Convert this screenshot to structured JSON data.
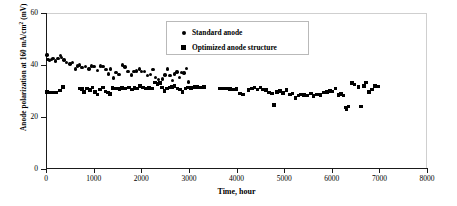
{
  "chart_data": {
    "type": "scatter",
    "title": "",
    "xlabel": "Time, hour",
    "ylabel": "Anode polarization at 160 mA/cm2 (mV)",
    "ylabel_main": "Anode polarization at 160 mA/cm",
    "ylabel_sup": "2",
    "ylabel_tail": " (mV)",
    "xlim": [
      0,
      8000
    ],
    "ylim": [
      0,
      60
    ],
    "xticks": [
      0,
      1000,
      2000,
      3000,
      4000,
      5000,
      6000,
      7000,
      8000
    ],
    "yticks": [
      0,
      20,
      40,
      60
    ],
    "xtick_labels": [
      "0",
      "1000",
      "2000",
      "3000",
      "4000",
      "5000",
      "6000",
      "7000",
      "8000"
    ],
    "ytick_labels": [
      "0",
      "20",
      "40",
      "60"
    ],
    "grid": false,
    "legend_position": "top-center",
    "series": [
      {
        "name": "Standard anode",
        "marker": "circle",
        "color": "#000000",
        "points": [
          [
            20,
            43.9
          ],
          [
            40,
            42.2
          ],
          [
            70,
            41.8
          ],
          [
            110,
            42.0
          ],
          [
            150,
            42.6
          ],
          [
            200,
            41.6
          ],
          [
            250,
            42.4
          ],
          [
            300,
            43.7
          ],
          [
            330,
            43.0
          ],
          [
            380,
            41.9
          ],
          [
            430,
            41.0
          ],
          [
            500,
            40.4
          ],
          [
            560,
            41.0
          ],
          [
            620,
            38.5
          ],
          [
            660,
            39.6
          ],
          [
            700,
            40.0
          ],
          [
            760,
            39.0
          ],
          [
            830,
            39.4
          ],
          [
            900,
            38.5
          ],
          [
            960,
            39.6
          ],
          [
            1010,
            39.4
          ],
          [
            1080,
            38.0
          ],
          [
            1140,
            39.6
          ],
          [
            1200,
            39.5
          ],
          [
            1260,
            38.3
          ],
          [
            1310,
            36.6
          ],
          [
            1360,
            38.4
          ],
          [
            1420,
            35.0
          ],
          [
            1470,
            37.0
          ],
          [
            1530,
            36.4
          ],
          [
            1600,
            40.0
          ],
          [
            1660,
            39.2
          ],
          [
            1720,
            37.4
          ],
          [
            1790,
            36.2
          ],
          [
            1850,
            37.5
          ],
          [
            1900,
            37.7
          ],
          [
            1960,
            38.4
          ],
          [
            2010,
            37.5
          ],
          [
            2070,
            37.6
          ],
          [
            2130,
            36.0
          ],
          [
            2190,
            36.4
          ],
          [
            2250,
            38.2
          ],
          [
            2300,
            35.3
          ],
          [
            2360,
            34.4
          ],
          [
            2400,
            33.2
          ],
          [
            2450,
            34.6
          ],
          [
            2500,
            36.2
          ],
          [
            2550,
            38.5
          ],
          [
            2600,
            36.0
          ],
          [
            2650,
            34.0
          ],
          [
            2700,
            36.6
          ],
          [
            2750,
            37.3
          ],
          [
            2800,
            35.2
          ],
          [
            2850,
            37.0
          ],
          [
            2900,
            36.9
          ],
          [
            2950,
            38.6
          ],
          [
            2990,
            33.4
          ]
        ]
      },
      {
        "name": "Optimized anode structure",
        "marker": "square",
        "color": "#000000",
        "points": [
          [
            20,
            29.6
          ],
          [
            60,
            29.5
          ],
          [
            140,
            29.4
          ],
          [
            210,
            29.5
          ],
          [
            300,
            30.2
          ],
          [
            360,
            31.6
          ],
          [
            700,
            31.0
          ],
          [
            760,
            30.7
          ],
          [
            800,
            29.6
          ],
          [
            860,
            31.0
          ],
          [
            920,
            30.3
          ],
          [
            980,
            31.3
          ],
          [
            1030,
            29.6
          ],
          [
            1080,
            28.7
          ],
          [
            1140,
            30.6
          ],
          [
            1200,
            31.3
          ],
          [
            1250,
            29.8
          ],
          [
            1300,
            29.5
          ],
          [
            1350,
            28.9
          ],
          [
            1400,
            31.2
          ],
          [
            1470,
            31.0
          ],
          [
            1540,
            30.8
          ],
          [
            1600,
            31.1
          ],
          [
            1670,
            31.0
          ],
          [
            1740,
            31.3
          ],
          [
            1800,
            30.6
          ],
          [
            1860,
            31.2
          ],
          [
            1920,
            31.0
          ],
          [
            1980,
            32.0
          ],
          [
            2040,
            31.4
          ],
          [
            2100,
            31.0
          ],
          [
            2160,
            31.2
          ],
          [
            2230,
            31.0
          ],
          [
            2290,
            33.2
          ],
          [
            2340,
            32.6
          ],
          [
            2390,
            33.0
          ],
          [
            2440,
            31.4
          ],
          [
            2490,
            30.0
          ],
          [
            2540,
            31.0
          ],
          [
            2590,
            31.3
          ],
          [
            2650,
            31.5
          ],
          [
            2700,
            32.0
          ],
          [
            2760,
            31.0
          ],
          [
            2810,
            30.6
          ],
          [
            2870,
            29.6
          ],
          [
            2930,
            31.0
          ],
          [
            2980,
            31.4
          ],
          [
            3050,
            31.1
          ],
          [
            3120,
            31.6
          ],
          [
            3180,
            31.5
          ],
          [
            3250,
            31.4
          ],
          [
            3320,
            31.6
          ],
          [
            3650,
            30.9
          ],
          [
            3720,
            31.0
          ],
          [
            3790,
            31.0
          ],
          [
            3860,
            30.7
          ],
          [
            3930,
            30.6
          ],
          [
            4000,
            30.8
          ],
          [
            4070,
            29.0
          ],
          [
            4140,
            28.7
          ],
          [
            4250,
            30.3
          ],
          [
            4320,
            31.0
          ],
          [
            4380,
            31.4
          ],
          [
            4440,
            30.6
          ],
          [
            4500,
            31.4
          ],
          [
            4560,
            30.5
          ],
          [
            4620,
            30.3
          ],
          [
            4680,
            29.4
          ],
          [
            4740,
            29.0
          ],
          [
            4790,
            24.6
          ],
          [
            4850,
            29.7
          ],
          [
            4910,
            30.0
          ],
          [
            4980,
            29.3
          ],
          [
            5050,
            30.3
          ],
          [
            5120,
            28.6
          ],
          [
            5180,
            29.0
          ],
          [
            5240,
            27.2
          ],
          [
            5300,
            28.2
          ],
          [
            5360,
            28.6
          ],
          [
            5420,
            28.4
          ],
          [
            5490,
            28.2
          ],
          [
            5560,
            29.0
          ],
          [
            5620,
            28.0
          ],
          [
            5690,
            28.7
          ],
          [
            5760,
            28.4
          ],
          [
            5830,
            29.4
          ],
          [
            5900,
            29.7
          ],
          [
            5960,
            30.1
          ],
          [
            6020,
            29.8
          ],
          [
            6080,
            31.0
          ],
          [
            6140,
            28.5
          ],
          [
            6200,
            28.8
          ],
          [
            6250,
            28.3
          ],
          [
            6290,
            23.7
          ],
          [
            6310,
            23.0
          ],
          [
            6350,
            24.0
          ],
          [
            6420,
            33.1
          ],
          [
            6480,
            32.5
          ],
          [
            6560,
            31.6
          ],
          [
            6620,
            24.1
          ],
          [
            6680,
            32.0
          ],
          [
            6720,
            33.2
          ],
          [
            6780,
            29.6
          ],
          [
            6840,
            30.6
          ],
          [
            6910,
            32.0
          ],
          [
            6970,
            31.8
          ]
        ]
      }
    ]
  },
  "legend": {
    "entries": [
      {
        "label": "Standard anode",
        "marker": "circle"
      },
      {
        "label": "Optimized anode structure",
        "marker": "square"
      }
    ]
  }
}
